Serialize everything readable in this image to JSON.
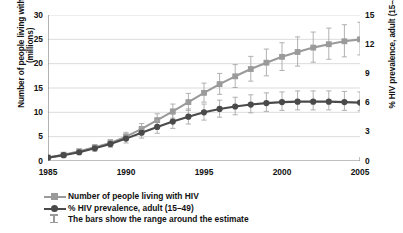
{
  "chart_data": {
    "type": "line",
    "title": "",
    "xlabel": "",
    "x": [
      1985,
      1986,
      1987,
      1988,
      1989,
      1990,
      1991,
      1992,
      1993,
      1994,
      1995,
      1996,
      1997,
      1998,
      1999,
      2000,
      2001,
      2002,
      2003,
      2004,
      2005
    ],
    "xlim": [
      1985,
      2005
    ],
    "xticks": [
      1985,
      1986,
      1987,
      1988,
      1989,
      1990,
      1991,
      1992,
      1993,
      1994,
      1995,
      1996,
      1997,
      1998,
      1999,
      2000,
      2001,
      2002,
      2003,
      2004,
      2005
    ],
    "xtick_labels": [
      "1985",
      "1990",
      "1995",
      "2000",
      "2005"
    ],
    "xtick_label_values": [
      1985,
      1990,
      1995,
      2000,
      2005
    ],
    "grid": true,
    "legend_position": "below-left",
    "axes": [
      {
        "side": "left",
        "ylabel": "Number of people living with HIV (millions)",
        "ylim": [
          0,
          30
        ],
        "yticks": [
          0,
          5,
          10,
          15,
          20,
          25,
          30
        ]
      },
      {
        "side": "right",
        "ylabel": "% HIV prevalence, adult (15–49)",
        "ylim": [
          0,
          15
        ],
        "yticks": [
          0,
          3,
          6,
          9,
          12,
          15
        ]
      }
    ],
    "series": [
      {
        "name": "Number of people living with HIV",
        "axis": "left",
        "unit": "millions",
        "color": "#9a9a9a",
        "marker": "square",
        "values": [
          0.7,
          1.3,
          2.0,
          2.8,
          3.7,
          5.0,
          6.6,
          8.4,
          10.2,
          12.1,
          14.0,
          15.8,
          17.4,
          18.9,
          20.2,
          21.4,
          22.4,
          23.3,
          24.0,
          24.6,
          25.0
        ],
        "error_low": [
          0.5,
          1.0,
          1.6,
          2.3,
          3.1,
          4.2,
          5.6,
          7.2,
          8.8,
          10.4,
          12.1,
          13.7,
          15.1,
          16.4,
          17.5,
          18.6,
          19.5,
          20.3,
          20.9,
          21.4,
          21.8
        ],
        "error_high": [
          0.9,
          1.6,
          2.4,
          3.3,
          4.4,
          5.9,
          7.7,
          9.7,
          11.7,
          13.9,
          16.0,
          18.0,
          19.8,
          21.5,
          23.0,
          24.3,
          25.5,
          26.5,
          27.3,
          28.0,
          28.5
        ]
      },
      {
        "name": "% HIV prevalence, adult (15–49)",
        "axis": "right",
        "unit": "%",
        "color": "#4a4a4a",
        "marker": "circle",
        "values": [
          0.35,
          0.6,
          0.9,
          1.3,
          1.75,
          2.3,
          2.9,
          3.5,
          4.05,
          4.55,
          5.0,
          5.35,
          5.6,
          5.8,
          5.95,
          6.05,
          6.1,
          6.1,
          6.1,
          6.05,
          6.0
        ],
        "error_low": [
          0.2,
          0.4,
          0.65,
          1.0,
          1.4,
          1.85,
          2.35,
          2.85,
          3.35,
          3.8,
          4.2,
          4.5,
          4.75,
          4.95,
          5.1,
          5.2,
          5.25,
          5.25,
          5.25,
          5.2,
          5.15
        ],
        "error_high": [
          0.5,
          0.85,
          1.2,
          1.65,
          2.15,
          2.8,
          3.5,
          4.2,
          4.8,
          5.35,
          5.85,
          6.25,
          6.55,
          6.8,
          7.0,
          7.1,
          7.2,
          7.2,
          7.2,
          7.15,
          7.1
        ]
      }
    ]
  },
  "legend": {
    "items": [
      {
        "label": "Number of people living with HIV",
        "marker": "square",
        "color": "#9a9a9a"
      },
      {
        "label": "% HIV prevalence, adult (15–49)",
        "marker": "circle",
        "color": "#4a4a4a"
      }
    ],
    "note": "The bars show the range around the estimate"
  }
}
